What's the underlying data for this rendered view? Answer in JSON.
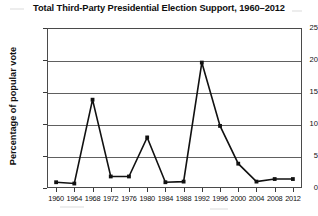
{
  "chart_data": {
    "type": "line",
    "title": "Total Third-Party Presidential Election Support, 1960–2012",
    "xlabel": "",
    "ylabel": "Percentage of popular vote",
    "categories": [
      "1960",
      "1964",
      "1968",
      "1972",
      "1976",
      "1980",
      "1984",
      "1988",
      "1992",
      "1996",
      "2000",
      "2004",
      "2008",
      "2012"
    ],
    "values": [
      0.9,
      0.7,
      13.8,
      1.8,
      1.8,
      7.9,
      0.9,
      1.0,
      19.6,
      9.7,
      3.8,
      1.0,
      1.4,
      1.4
    ],
    "ylim": [
      0,
      25
    ],
    "yticks": [
      0,
      5,
      10,
      15,
      20,
      25
    ],
    "ytick_labels": [
      "0",
      "5",
      "10",
      "15",
      "20",
      "25"
    ],
    "grid": true,
    "legend": false,
    "marker": "square",
    "line_color": "#111111",
    "marker_color": "#111111",
    "grid_color": "#606060",
    "background": "#ffffff"
  }
}
